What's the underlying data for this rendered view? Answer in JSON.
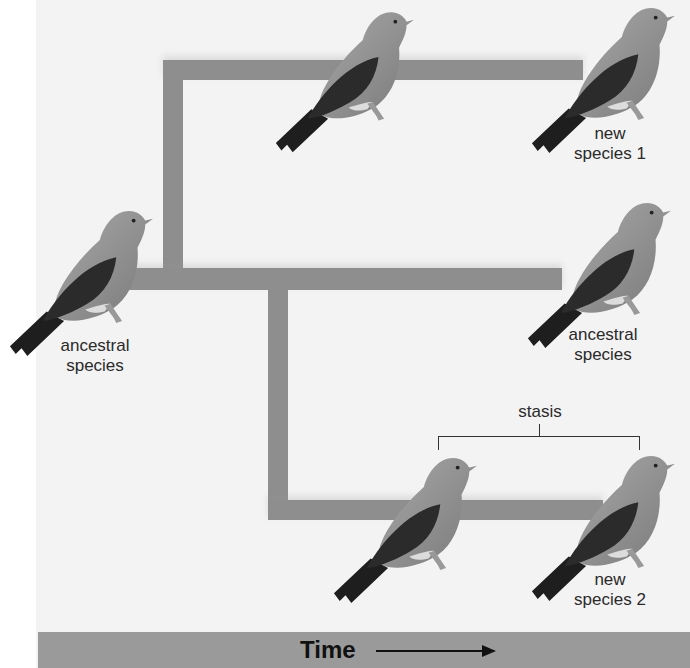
{
  "diagram": {
    "colors": {
      "background": "#f3f3f3",
      "branch": "#8e8e8e",
      "timebar": "#9a9a9a",
      "text": "#2a2a2a",
      "bird_body": "#8a8a8a",
      "bird_wing": "#2a2a2a"
    },
    "nodes": [
      {
        "id": "ancestral-left",
        "label_line1": "ancestral",
        "label_line2": "species"
      },
      {
        "id": "top-middle",
        "label_line1": "",
        "label_line2": ""
      },
      {
        "id": "new-species-1",
        "label_line1": "new",
        "label_line2": "species 1"
      },
      {
        "id": "ancestral-right",
        "label_line1": "ancestral",
        "label_line2": "species"
      },
      {
        "id": "bottom-middle",
        "label_line1": "",
        "label_line2": ""
      },
      {
        "id": "new-species-2",
        "label_line1": "new",
        "label_line2": "species 2"
      }
    ],
    "stasis_label": "stasis",
    "time_label": "Time",
    "time_arrow": "right-arrow"
  }
}
